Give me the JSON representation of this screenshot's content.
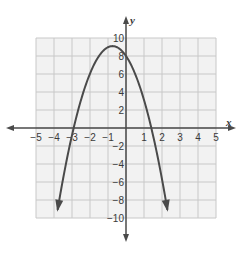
{
  "chart_data": {
    "type": "line",
    "title": "",
    "xlabel": "x",
    "ylabel": "y",
    "xlim": [
      -5,
      5
    ],
    "ylim": [
      -10,
      10
    ],
    "grid": true,
    "x_ticks": [
      -5,
      -4,
      -3,
      -2,
      -1,
      1,
      2,
      3,
      4,
      5
    ],
    "x_tick_labels": [
      "−5",
      "−4",
      "−3",
      "−2",
      "−1",
      "1",
      "2",
      "3",
      "4",
      "5"
    ],
    "y_ticks": [
      10,
      8,
      6,
      4,
      2,
      -2,
      -4,
      -6,
      -8,
      -10
    ],
    "y_tick_labels": [
      "10",
      "8",
      "6",
      "4",
      "2",
      "−2",
      "−4",
      "−6",
      "−8",
      "−10"
    ],
    "series": [
      {
        "name": "parabola",
        "description": "Downward-opening parabola with arrows at both ends",
        "vertex": [
          -0.75,
          9.1
        ],
        "y_intercept": 8,
        "x_intercepts": [
          -2.8,
          1.4
        ],
        "endpoints": [
          [
            -3.8,
            -10
          ],
          [
            2.3,
            -10
          ]
        ],
        "equation_approx": "y = -2x^2 - 3x + 8",
        "color": "#4a4a4a"
      }
    ]
  },
  "colors": {
    "grid_fill": "#f2f2f2",
    "grid_line": "#c8c8c8",
    "axis": "#4a4a4a",
    "curve": "#4a4a4a"
  }
}
